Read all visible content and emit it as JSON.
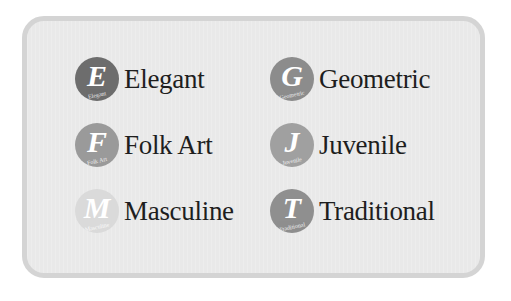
{
  "panel": {
    "items": [
      {
        "letter": "E",
        "label": "Elegant",
        "sublabel": "Elegant",
        "color": "#6d6d6d"
      },
      {
        "letter": "G",
        "label": "Geometric",
        "sublabel": "Geometric",
        "color": "#8c8c8c"
      },
      {
        "letter": "F",
        "label": "Folk Art",
        "sublabel": "Folk Art",
        "color": "#9a9a9a"
      },
      {
        "letter": "J",
        "label": "Juvenile",
        "sublabel": "Juvenile",
        "color": "#a0a0a0"
      },
      {
        "letter": "M",
        "label": "Masculine",
        "sublabel": "Masculine",
        "color": "#dadada"
      },
      {
        "letter": "T",
        "label": "Traditional",
        "sublabel": "Traditional",
        "color": "#8f8f8f"
      }
    ]
  }
}
